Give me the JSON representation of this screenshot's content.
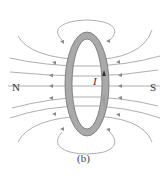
{
  "diagram": {
    "labels": {
      "north": "N",
      "south": "S",
      "current": "I"
    },
    "caption": "(b)",
    "colors": {
      "ring_fill": "#a9a9a9",
      "ring_stroke": "#6e6e6e",
      "field_lines": "#8a8a8a",
      "text": "#333333"
    }
  }
}
